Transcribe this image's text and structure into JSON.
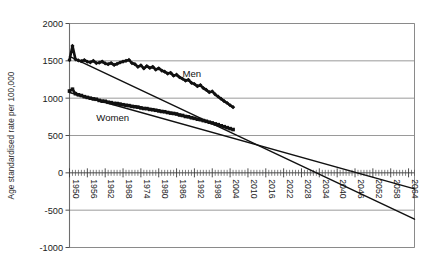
{
  "chart_data": {
    "type": "line",
    "title": "",
    "xlabel": "",
    "ylabel": "Age standardised rate per 100,000",
    "xlim": [
      1950,
      2066
    ],
    "ylim": [
      -1000,
      2000
    ],
    "ytick_values": [
      2000,
      1500,
      1000,
      500,
      0,
      -500,
      -1000
    ],
    "ytick_labels": [
      "2000",
      "1500",
      "1000",
      "500",
      "0",
      "-500",
      "-1000"
    ],
    "xtick_values": [
      1950,
      1956,
      1962,
      1968,
      1974,
      1980,
      1986,
      1992,
      1998,
      2004,
      2010,
      2016,
      2022,
      2028,
      2034,
      2040,
      2046,
      2052,
      2058,
      2064
    ],
    "xtick_labels": [
      "1950",
      "1956",
      "1962",
      "1968",
      "1974",
      "1980",
      "1986",
      "1992",
      "1998",
      "2004",
      "2010",
      "2016",
      "2022",
      "2028",
      "2034",
      "2040",
      "2046",
      "2052",
      "2058",
      "2064"
    ],
    "xtick_rotation": 90,
    "grid": "horizontal",
    "legend_position": "inline-annotation",
    "annotations": [
      {
        "text": "Men",
        "x": 1988,
        "y": 1290
      },
      {
        "text": "Women",
        "x": 1959,
        "y": 700
      }
    ],
    "series": [
      {
        "name": "Men",
        "marker": "diamond",
        "observed_x": [
          1950,
          1951,
          1952,
          1953,
          1954,
          1955,
          1956,
          1957,
          1958,
          1959,
          1960,
          1961,
          1962,
          1963,
          1964,
          1965,
          1966,
          1967,
          1968,
          1969,
          1970,
          1971,
          1972,
          1973,
          1974,
          1975,
          1976,
          1977,
          1978,
          1979,
          1980,
          1981,
          1982,
          1983,
          1984,
          1985,
          1986,
          1987,
          1988,
          1989,
          1990,
          1991,
          1992,
          1993,
          1994,
          1995,
          1996,
          1997,
          1998,
          1999,
          2000,
          2001,
          2002,
          2003,
          2004,
          2005
        ],
        "observed_y": [
          1510,
          1700,
          1520,
          1505,
          1495,
          1510,
          1488,
          1480,
          1500,
          1470,
          1475,
          1490,
          1465,
          1455,
          1470,
          1445,
          1460,
          1478,
          1490,
          1500,
          1512,
          1470,
          1455,
          1420,
          1440,
          1398,
          1430,
          1405,
          1420,
          1382,
          1400,
          1370,
          1355,
          1330,
          1340,
          1300,
          1315,
          1280,
          1260,
          1235,
          1245,
          1205,
          1190,
          1160,
          1175,
          1135,
          1110,
          1080,
          1090,
          1050,
          1020,
          990,
          960,
          935,
          905,
          880
        ],
        "trend_x": [
          1950,
          2066
        ],
        "trend_y": [
          1560,
          -620
        ]
      },
      {
        "name": "Women",
        "marker": "square",
        "observed_x": [
          1950,
          1951,
          1952,
          1953,
          1954,
          1955,
          1956,
          1957,
          1958,
          1959,
          1960,
          1961,
          1962,
          1963,
          1964,
          1965,
          1966,
          1967,
          1968,
          1969,
          1970,
          1971,
          1972,
          1973,
          1974,
          1975,
          1976,
          1977,
          1978,
          1979,
          1980,
          1981,
          1982,
          1983,
          1984,
          1985,
          1986,
          1987,
          1988,
          1989,
          1990,
          1991,
          1992,
          1993,
          1994,
          1995,
          1996,
          1997,
          1998,
          1999,
          2000,
          2001,
          2002,
          2003,
          2004,
          2005
        ],
        "observed_y": [
          1095,
          1120,
          1060,
          1045,
          1035,
          1020,
          1010,
          1000,
          990,
          985,
          970,
          960,
          958,
          945,
          940,
          930,
          928,
          920,
          912,
          905,
          900,
          890,
          885,
          880,
          870,
          862,
          860,
          850,
          845,
          838,
          830,
          822,
          818,
          808,
          800,
          795,
          788,
          775,
          768,
          755,
          750,
          738,
          730,
          718,
          712,
          700,
          690,
          678,
          668,
          655,
          645,
          630,
          618,
          605,
          592,
          580
        ],
        "trend_x": [
          1950,
          2066
        ],
        "trend_y": [
          1075,
          -215
        ]
      }
    ]
  }
}
